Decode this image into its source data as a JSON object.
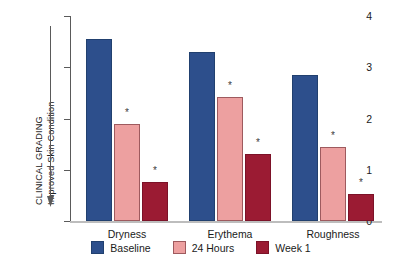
{
  "chart_data": {
    "type": "bar",
    "title": "",
    "xlabel": "",
    "ylabel": "CLINICAL GRADING Improved Skin Condition",
    "ylabel_lines": [
      "CLINICAL GRADING",
      "Improved Skin Condition"
    ],
    "categories": [
      "Dryness",
      "Erythema",
      "Roughness"
    ],
    "ylim": [
      0,
      4
    ],
    "yticks": [
      "0",
      "1",
      "2",
      "3",
      "4"
    ],
    "grid": false,
    "legend_position": "bottom",
    "series": [
      {
        "name": "Baseline",
        "color": "#2d4f8c",
        "values": [
          3.55,
          3.29,
          2.85
        ],
        "significance": [
          "",
          "",
          ""
        ]
      },
      {
        "name": "24 Hours",
        "color": "#eda0a0",
        "values": [
          1.9,
          2.42,
          1.44
        ],
        "significance": [
          "*",
          "*",
          "*"
        ]
      },
      {
        "name": "Week 1",
        "color": "#9b1b33",
        "values": [
          0.76,
          1.3,
          0.52
        ],
        "significance": [
          "*",
          "*",
          "*"
        ]
      }
    ],
    "annotations": {
      "axis_arrow": "downward-arrow",
      "significance_marker": "*"
    }
  },
  "legend": {
    "items": [
      {
        "label": "Baseline"
      },
      {
        "label": "24 Hours"
      },
      {
        "label": "Week 1"
      }
    ]
  },
  "axis": {
    "y_title_line1": "CLINICAL GRADING",
    "y_title_line2": "Improved Skin Condition"
  }
}
